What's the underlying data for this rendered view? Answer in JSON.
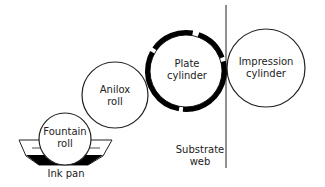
{
  "diagram": {
    "components": {
      "fountain_roll": {
        "label_line1": "Fountain",
        "label_line2": "roll"
      },
      "anilox_roll": {
        "label_line1": "Anilox",
        "label_line2": "roll"
      },
      "plate_cylinder": {
        "label_line1": "Plate",
        "label_line2": "cylinder"
      },
      "impression_cylinder": {
        "label_line1": "Impression",
        "label_line2": "cylinder"
      },
      "substrate_web": {
        "label_line1": "Substrate",
        "label_line2": "web"
      },
      "ink_pan": {
        "label": "Ink pan"
      }
    },
    "colors": {
      "stroke": "#111111",
      "ink": "#000000",
      "background": "#ffffff"
    }
  }
}
